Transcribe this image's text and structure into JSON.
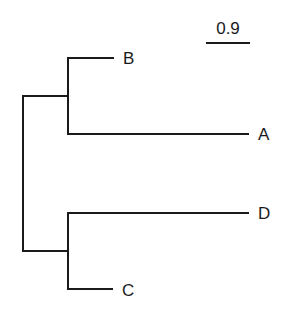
{
  "diagram": {
    "type": "phylogenetic-tree",
    "scale_bar": {
      "label": "0.9"
    },
    "taxa": [
      {
        "id": "B",
        "label": "B"
      },
      {
        "id": "A",
        "label": "A"
      },
      {
        "id": "D",
        "label": "D"
      },
      {
        "id": "C",
        "label": "C"
      }
    ],
    "topology": "((B,A),(D,C))",
    "colors": {
      "line": "#1a1a1a",
      "background": "#ffffff"
    }
  }
}
